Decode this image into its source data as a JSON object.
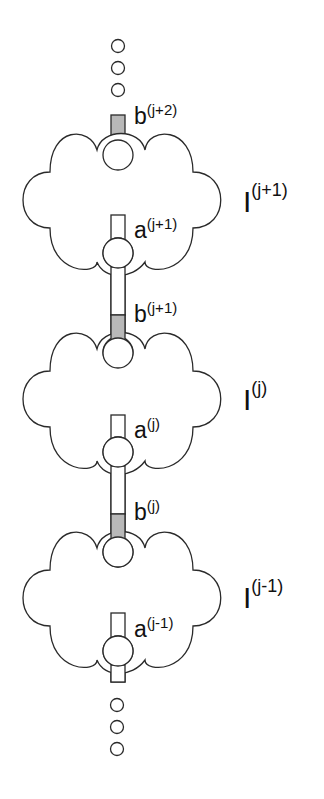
{
  "diagram": {
    "colors": {
      "outline": "#2a2a2a",
      "shaded": "#b8b8b8",
      "background": "#ffffff"
    },
    "ellipsis_top": {
      "dots": 3
    },
    "ellipsis_bottom": {
      "dots": 3
    },
    "blocks": [
      {
        "id": "j+1",
        "region_label": "I",
        "region_sup": "(j+1)",
        "top_port_label": "b",
        "top_port_sup": "(j+2)",
        "bottom_port_label": "a",
        "bottom_port_sup": "(j+1)"
      },
      {
        "id": "j",
        "region_label": "I",
        "region_sup": "(j)",
        "top_port_label": "b",
        "top_port_sup": "(j+1)",
        "bottom_port_label": "a",
        "bottom_port_sup": "(j)"
      },
      {
        "id": "j-1",
        "region_label": "I",
        "region_sup": "(j-1)",
        "top_port_label": "b",
        "top_port_sup": "(j)",
        "bottom_port_label": "a",
        "bottom_port_sup": "(j-1)"
      }
    ]
  }
}
